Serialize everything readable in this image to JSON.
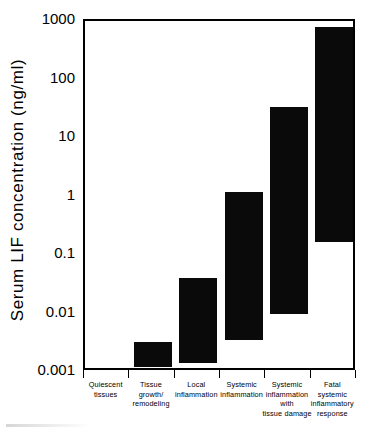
{
  "chart_data": {
    "type": "bar",
    "title": "",
    "subtitle": "",
    "xlabel": "",
    "ylabel": "Serum LIF concentration  (ng/ml)",
    "yscale": "log",
    "ylim": [
      0.001,
      1000
    ],
    "ytick_values": [
      1000,
      100,
      10,
      1,
      0.1,
      0.01,
      0.001
    ],
    "ytick_labels": [
      "1000",
      "100",
      "10",
      "1",
      "0.1",
      "0.01",
      "0.001"
    ],
    "grid": false,
    "legend": "none",
    "bar_color": "#0a0a0a",
    "note": "Floating range bars: each bar spans the low-to-high serum LIF concentration observed for that clinical category.",
    "categories": [
      "Quiescent tissues",
      "Tissue growth/ remodeling",
      "Local inflammation",
      "Systemic inflammation",
      "Systemic inflammation with tissue damage",
      "Fatal systemic inflammatory response"
    ],
    "category_label_lines": [
      [
        "Quiescent",
        "tissues"
      ],
      [
        "Tissue",
        "growth/",
        "remodeling"
      ],
      [
        "Local",
        "inflammation"
      ],
      [
        "Systemic",
        "inflammation"
      ],
      [
        "Systemic",
        "inflammation",
        "with",
        "tissue damage"
      ],
      [
        "Fatal",
        "systemic",
        "inflammatory",
        "response"
      ]
    ],
    "series": [
      {
        "name": "Serum LIF range",
        "low": [
          null,
          0.0012,
          0.0014,
          0.0035,
          0.0098,
          0.17
        ],
        "high": [
          null,
          0.0032,
          0.04,
          1.2,
          34,
          800
        ]
      }
    ]
  },
  "axis": {
    "y_title": "Serum LIF concentration  (ng/ml)",
    "y_ticks": [
      {
        "label": "1000",
        "value": 1000
      },
      {
        "label": "100",
        "value": 100
      },
      {
        "label": "10",
        "value": 10
      },
      {
        "label": "1",
        "value": 1
      },
      {
        "label": "0.1",
        "value": 0.1
      },
      {
        "label": "0.01",
        "value": 0.01
      },
      {
        "label": "0.001",
        "value": 0.001
      }
    ]
  }
}
